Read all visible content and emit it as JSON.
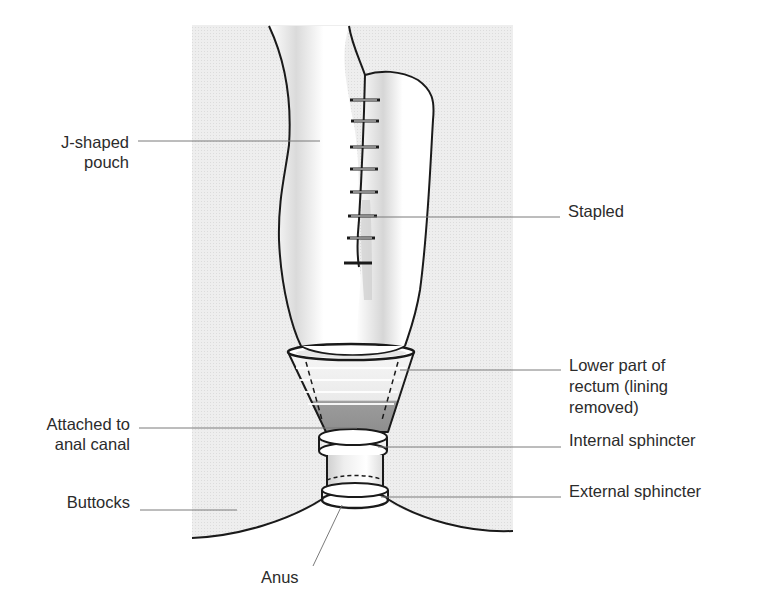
{
  "diagram": {
    "colors": {
      "background": "#ffffff",
      "panel_gray": "#ececec",
      "outline": "#1a1a1a",
      "leader_line": "#7a7a7a",
      "shade_dark": "#9a9a9a",
      "shade_mid": "#d2d2d2",
      "label_text": "#2b2b2b"
    },
    "labels": {
      "j_pouch": {
        "lines": [
          "J-shaped",
          "pouch"
        ]
      },
      "stapled": {
        "lines": [
          "Stapled"
        ]
      },
      "lower_rectum": {
        "lines": [
          "Lower part of",
          "rectum (lining",
          "removed)"
        ]
      },
      "attached_anal_canal": {
        "lines": [
          "Attached to",
          "anal canal"
        ]
      },
      "internal_sphincter": {
        "lines": [
          "Internal sphincter"
        ]
      },
      "buttocks": {
        "lines": [
          "Buttocks"
        ]
      },
      "external_sphincter": {
        "lines": [
          "External sphincter"
        ]
      },
      "anus": {
        "lines": [
          "Anus"
        ]
      }
    }
  }
}
